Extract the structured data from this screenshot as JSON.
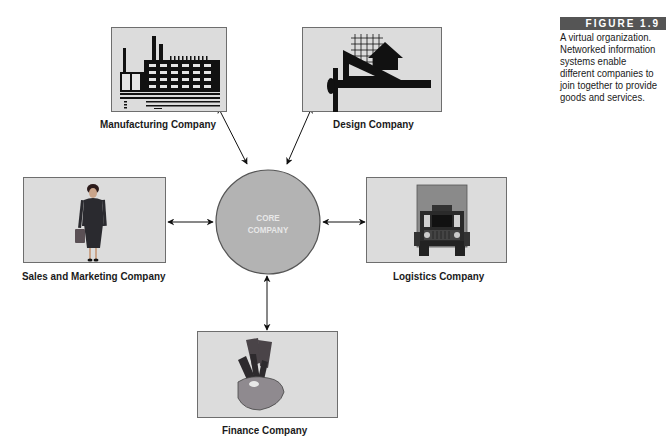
{
  "figure": {
    "number_label": "FIGURE 1.9",
    "caption": "A virtual organization. Networked information systems enable different companies to join together to provide goods and services."
  },
  "core": {
    "line1": "CORE",
    "line2": "COMPANY"
  },
  "nodes": [
    {
      "id": "manufacturing",
      "label": "Manufacturing Company",
      "icon": "factory-icon"
    },
    {
      "id": "design",
      "label": "Design Company",
      "icon": "drafting-tools-icon"
    },
    {
      "id": "sales",
      "label": "Sales and Marketing Company",
      "icon": "businesswoman-icon"
    },
    {
      "id": "logistics",
      "label": "Logistics Company",
      "icon": "truck-icon"
    },
    {
      "id": "finance",
      "label": "Finance Company",
      "icon": "hand-with-money-icon"
    }
  ],
  "colors": {
    "box_fill": "#dcdcdc",
    "core_fill": "#b3b3b3",
    "header_fill": "#555555"
  }
}
